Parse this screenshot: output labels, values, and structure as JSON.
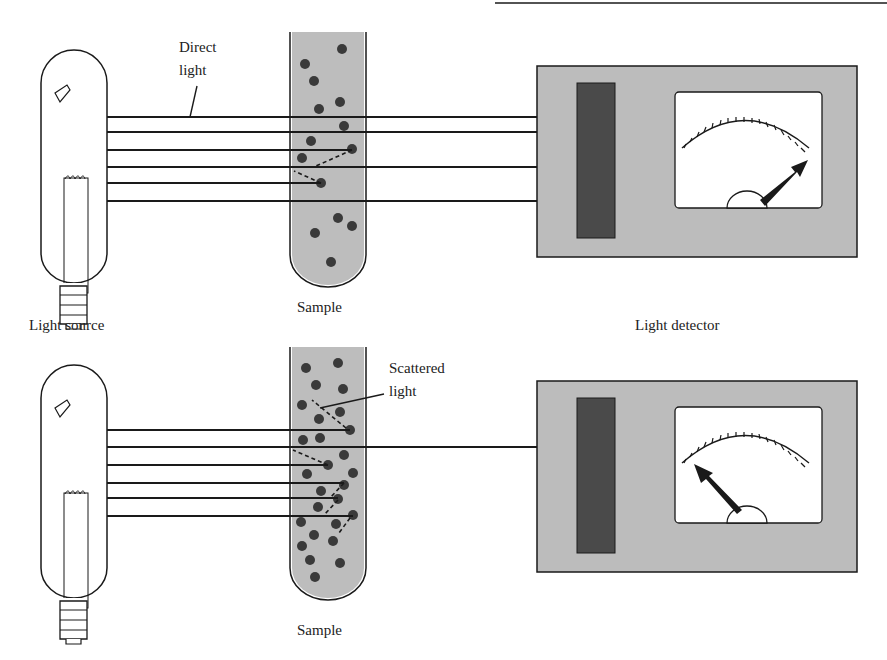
{
  "figure": {
    "colors": {
      "ink": "#1a1a1a",
      "sample_fill": "#bdbdbd",
      "detector_body": "#bcbcbc",
      "detector_strip": "#4a4a4a",
      "particle": "#3a3a3a",
      "meter_face": "#ffffff"
    }
  },
  "panels": [
    {
      "id": "top",
      "labels": {
        "beam_callout": [
          "Direct",
          "light"
        ],
        "sample": "Sample",
        "source": "Light source",
        "detector": "Light detector"
      },
      "meter_reading": "high"
    },
    {
      "id": "bottom",
      "labels": {
        "beam_callout": [
          "Scattered",
          "light"
        ],
        "sample": "Sample"
      },
      "meter_reading": "low"
    }
  ]
}
